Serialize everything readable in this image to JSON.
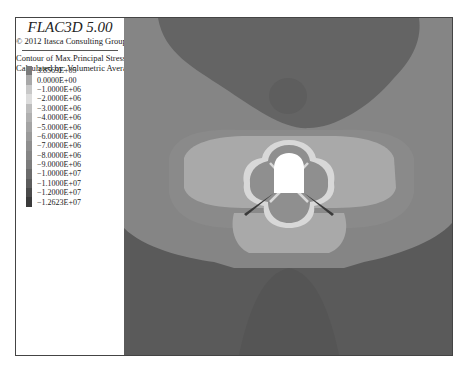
{
  "legend": {
    "title": "FLAC3D 5.00",
    "copyright": "© 2012 Itasca Consulting Group,Inc.",
    "contour_label": "Contour of Max.Principal Stress",
    "method_label": "Calculated by: Volumetric Averaging",
    "levels": [
      {
        "label": "3.8569E+05",
        "color": "#7a7a7a"
      },
      {
        "label": "0.0000E+00",
        "color": "#a8a8a8"
      },
      {
        "label": "−1.0000E+06",
        "color": "#c8c8c8"
      },
      {
        "label": "−2.0000E+06",
        "color": "#dcdcdc"
      },
      {
        "label": "−3.0000E+06",
        "color": "#bdbdbd"
      },
      {
        "label": "−4.0000E+06",
        "color": "#b0b0b0"
      },
      {
        "label": "−5.0000E+06",
        "color": "#a4a4a4"
      },
      {
        "label": "−6.0000E+06",
        "color": "#9a9a9a"
      },
      {
        "label": "−7.0000E+06",
        "color": "#8e8e8e"
      },
      {
        "label": "−8.0000E+06",
        "color": "#858585"
      },
      {
        "label": "−9.0000E+06",
        "color": "#7c7c7c"
      },
      {
        "label": "−1.0000E+07",
        "color": "#6b6b6b"
      },
      {
        "label": "−1.1000E+07",
        "color": "#5c5c5c"
      },
      {
        "label": "−1.2000E+07",
        "color": "#4a4a4a"
      },
      {
        "label": "−1.2623E+07",
        "color": "#3a3a3a"
      }
    ]
  },
  "chart_data": {
    "type": "heatmap",
    "title": "Contour of Max.Principal Stress",
    "software": "FLAC3D 5.00",
    "method": "Volumetric Averaging",
    "units": "Pa",
    "range": [
      -12623000.0,
      385690.0
    ],
    "levels": [
      385690,
      0,
      -1000000,
      -2000000,
      -3000000,
      -4000000,
      -5000000,
      -6000000,
      -7000000,
      -8000000,
      -9000000,
      -10000000,
      -11000000,
      -12000000,
      -12623000
    ],
    "level_labels": [
      "3.8569E+05",
      "0.0000E+00",
      "-1.0000E+06",
      "-2.0000E+06",
      "-3.0000E+06",
      "-4.0000E+06",
      "-5.0000E+06",
      "-6.0000E+06",
      "-7.0000E+06",
      "-8.0000E+06",
      "-9.0000E+06",
      "-1.0000E+07",
      "-1.1000E+07",
      "-1.2000E+07",
      "-1.2623E+07"
    ],
    "legend_position": "left"
  },
  "plot": {
    "colors": {
      "background": "#858585",
      "top_dark": "#646464",
      "top_blob": "#5e5e5e",
      "bottom_dark": "#5a5a5a",
      "bottom_cone": "#555555",
      "mid_band": "#8a8a8a",
      "outer_lobe": "#a9a9a9",
      "inner_ring": "#d8d8d8",
      "inner_fill": "#8f8f8f",
      "opening": "#ffffff",
      "crack": "#3a3a3a"
    }
  }
}
